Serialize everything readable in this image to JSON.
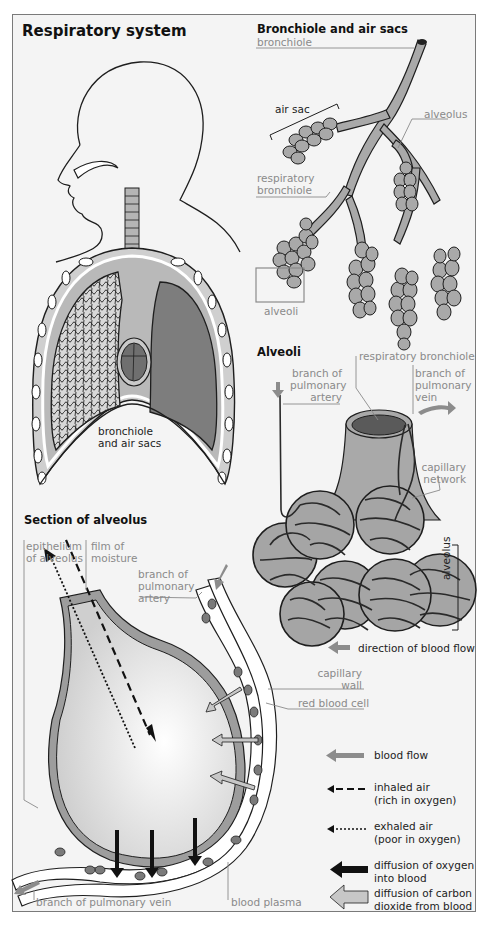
{
  "page": {
    "background": "#ffffff",
    "panel_background": "#f4f4f4",
    "border_color": "#7a7a7a"
  },
  "colors": {
    "tissue_light": "#c9c9c9",
    "tissue_mid": "#a9a9a9",
    "tissue_dark": "#7d7d7d",
    "outline": "#1e1e1e",
    "label_gray": "#8a8a8a",
    "arrow_gray": "#8c8c8c"
  },
  "respiratory_system": {
    "title": "Respiratory system",
    "label_bronchiole_air_sacs_line1": "bronchiole",
    "label_bronchiole_air_sacs_line2": "and air sacs"
  },
  "bronchiole_and_air_sacs": {
    "title": "Bronchiole and air sacs",
    "labels": {
      "bronchiole": "bronchiole",
      "air_sac": "air sac",
      "alveolus": "alveolus",
      "respiratory_bronchiole_line1": "respiratory",
      "respiratory_bronchiole_line2": "bronchiole",
      "alveoli": "alveoli"
    }
  },
  "alveoli": {
    "title": "Alveoli",
    "labels": {
      "respiratory_bronchiole": "respiratory bronchiole",
      "branch_pulmonary_artery_line1": "branch of",
      "branch_pulmonary_artery_line2": "pulmonary",
      "branch_pulmonary_artery_line3": "artery",
      "branch_pulmonary_vein_line1": "branch of",
      "branch_pulmonary_vein_line2": "pulmonary",
      "branch_pulmonary_vein_line3": "vein",
      "capillary_network_line1": "capillary",
      "capillary_network_line2": "network",
      "alveolus": "alveolus",
      "direction_of_blood_flow": "direction of blood flow"
    }
  },
  "section_of_alveolus": {
    "title": "Section of alveolus",
    "labels": {
      "epithelium_line1": "epithelium",
      "epithelium_line2": "of alveolus",
      "film_line1": "film of",
      "film_line2": "moisture",
      "branch_pulmonary_artery_line1": "branch of",
      "branch_pulmonary_artery_line2": "pulmonary",
      "branch_pulmonary_artery_line3": "artery",
      "capillary_wall_line1": "capillary",
      "capillary_wall_line2": "wall",
      "red_blood_cell": "red blood cell",
      "branch_pulmonary_vein": "branch of pulmonary vein",
      "blood_plasma": "blood plasma"
    }
  },
  "legend": {
    "items": [
      {
        "symbol": "gray-arrow",
        "line1": "blood flow",
        "line2": ""
      },
      {
        "symbol": "dashed-arrow",
        "line1": "inhaled air",
        "line2": "(rich in oxygen)"
      },
      {
        "symbol": "dotted-arrow",
        "line1": "exhaled air",
        "line2": "(poor in oxygen)"
      },
      {
        "symbol": "black-arrow",
        "line1": "diffusion of oxygen",
        "line2": "into blood"
      },
      {
        "symbol": "hollow-gray-arrow",
        "line1": "diffusion of carbon",
        "line2": "dioxide from blood"
      }
    ]
  }
}
